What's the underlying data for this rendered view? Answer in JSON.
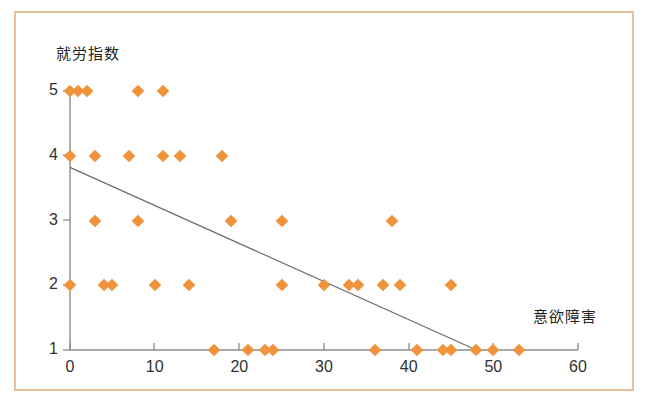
{
  "figure": {
    "border_color": "#eec09a",
    "background": "#ffffff",
    "marker_color": "#f0943c",
    "axis_color": "#8c8c8c",
    "trendline_color": "#6d6d6d"
  },
  "chart_data": {
    "type": "scatter",
    "title": "",
    "xlabel": "意欲障害",
    "ylabel": "就労指数",
    "xlim": [
      0,
      60
    ],
    "ylim": [
      1,
      5
    ],
    "xticks": [
      0,
      10,
      20,
      30,
      40,
      50,
      60
    ],
    "xtick_labels": [
      "0",
      "10",
      "20",
      "30",
      "40",
      "50",
      "60"
    ],
    "yticks": [
      1,
      2,
      3,
      4,
      5
    ],
    "ytick_labels": [
      "1",
      "2",
      "3",
      "4",
      "5"
    ],
    "grid": false,
    "legend": null,
    "marker": "diamond",
    "points": [
      {
        "x": 0,
        "y": 5
      },
      {
        "x": 1,
        "y": 5
      },
      {
        "x": 2,
        "y": 5
      },
      {
        "x": 8,
        "y": 5
      },
      {
        "x": 11,
        "y": 5
      },
      {
        "x": 0,
        "y": 4
      },
      {
        "x": 3,
        "y": 4
      },
      {
        "x": 7,
        "y": 4
      },
      {
        "x": 11,
        "y": 4
      },
      {
        "x": 13,
        "y": 4
      },
      {
        "x": 18,
        "y": 4
      },
      {
        "x": 3,
        "y": 3
      },
      {
        "x": 8,
        "y": 3
      },
      {
        "x": 19,
        "y": 3
      },
      {
        "x": 25,
        "y": 3
      },
      {
        "x": 38,
        "y": 3
      },
      {
        "x": 0,
        "y": 2
      },
      {
        "x": 4,
        "y": 2
      },
      {
        "x": 5,
        "y": 2
      },
      {
        "x": 10,
        "y": 2
      },
      {
        "x": 14,
        "y": 2
      },
      {
        "x": 25,
        "y": 2
      },
      {
        "x": 30,
        "y": 2
      },
      {
        "x": 33,
        "y": 2
      },
      {
        "x": 34,
        "y": 2
      },
      {
        "x": 37,
        "y": 2
      },
      {
        "x": 39,
        "y": 2
      },
      {
        "x": 45,
        "y": 2
      },
      {
        "x": 17,
        "y": 1
      },
      {
        "x": 21,
        "y": 1
      },
      {
        "x": 23,
        "y": 1
      },
      {
        "x": 24,
        "y": 1
      },
      {
        "x": 36,
        "y": 1
      },
      {
        "x": 41,
        "y": 1
      },
      {
        "x": 44,
        "y": 1
      },
      {
        "x": 45,
        "y": 1
      },
      {
        "x": 48,
        "y": 1
      },
      {
        "x": 50,
        "y": 1
      },
      {
        "x": 53,
        "y": 1
      }
    ],
    "trendline": {
      "x0": 0,
      "y0": 3.82,
      "x1": 48,
      "y1": 1.0
    }
  }
}
